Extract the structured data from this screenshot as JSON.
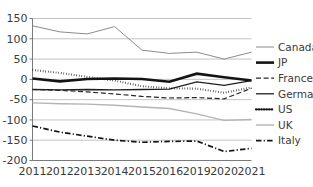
{
  "chart_data": {
    "type": "line",
    "title": "",
    "subtitle": "",
    "xlabel": "",
    "ylabel": "",
    "grid": true,
    "legend_position": "right",
    "categories": [
      "2011",
      "2012",
      "2013",
      "2014",
      "2015",
      "2016",
      "2019",
      "2020",
      "2021"
    ],
    "x_tick_labels": [
      "2011",
      "2012",
      "2013",
      "2014",
      "2015",
      "2016",
      "2019",
      "2020",
      "2021"
    ],
    "y_tick_labels": [
      "150",
      "100",
      "50",
      "0",
      "-50",
      "-100",
      "-150",
      "-200"
    ],
    "y_ticks": [
      150,
      100,
      50,
      0,
      -50,
      -100,
      -150,
      -200
    ],
    "ylim": [
      -200,
      150
    ],
    "series": [
      {
        "name": "Canada",
        "style": "solid",
        "color": "#8c8c8c",
        "width": 1.0,
        "values": [
          132,
          117,
          112,
          130,
          72,
          64,
          67,
          50,
          67
        ]
      },
      {
        "name": "JP",
        "style": "solid",
        "color": "#141414",
        "width": 2.6,
        "values": [
          2,
          -5,
          1,
          2,
          1,
          -6,
          14,
          5,
          -3
        ]
      },
      {
        "name": "France",
        "style": "dashed",
        "color": "#262626",
        "width": 1.2,
        "values": [
          -25,
          -27,
          -31,
          -36,
          -42,
          -46,
          -45,
          -48,
          -22
        ]
      },
      {
        "name": "Germany",
        "style": "solid",
        "color": "#1e1e1e",
        "width": 1.3,
        "values": [
          -25,
          -26,
          -25,
          -26,
          -25,
          -24,
          -6,
          -15,
          -3
        ]
      },
      {
        "name": "US",
        "style": "dotted",
        "color": "#141414",
        "width": 2.1,
        "values": [
          23,
          16,
          6,
          -3,
          -17,
          -22,
          -23,
          -33,
          -20
        ]
      },
      {
        "name": "UK",
        "style": "solid",
        "color": "#b4b4b4",
        "width": 1.4,
        "values": [
          -58,
          -60,
          -61,
          -64,
          -68,
          -72,
          -85,
          -101,
          -99
        ]
      },
      {
        "name": "Italy",
        "style": "dashdot",
        "color": "#141414",
        "width": 1.7,
        "values": [
          -115,
          -130,
          -140,
          -150,
          -155,
          -153,
          -152,
          -178,
          -170
        ]
      }
    ],
    "legend_entries": [
      "Canada",
      "JP",
      "France",
      "Germany",
      "US",
      "UK",
      "Italy"
    ]
  }
}
